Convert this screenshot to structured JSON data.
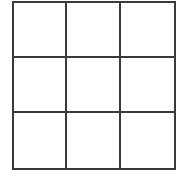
{
  "game": {
    "type": "tic-tac-toe",
    "rows": 3,
    "cols": 3,
    "line_color": "#3a3a3a",
    "background": "#ffffff",
    "cells": [
      [
        "",
        "",
        ""
      ],
      [
        "",
        "",
        ""
      ],
      [
        "",
        "",
        ""
      ]
    ]
  }
}
